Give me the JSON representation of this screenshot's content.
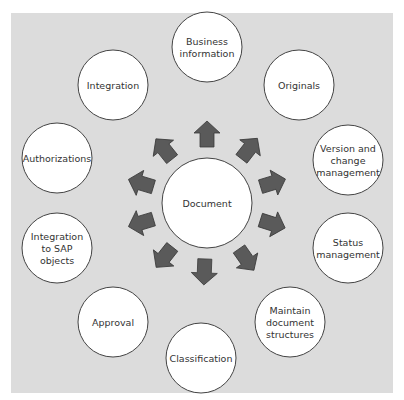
{
  "diagram": {
    "center": {
      "label": [
        "Document"
      ]
    },
    "nodes": [
      {
        "id": "business-information",
        "label": [
          "Business",
          "information"
        ]
      },
      {
        "id": "originals",
        "label": [
          "Originals"
        ]
      },
      {
        "id": "version-and-change-management",
        "label": [
          "Version and",
          "change",
          "management"
        ]
      },
      {
        "id": "status-management",
        "label": [
          "Status",
          "management"
        ]
      },
      {
        "id": "maintain-document-structures",
        "label": [
          "Maintain",
          "document",
          "structures"
        ]
      },
      {
        "id": "classification",
        "label": [
          "Classification"
        ]
      },
      {
        "id": "approval",
        "label": [
          "Approval"
        ]
      },
      {
        "id": "integration-to-sap-objects",
        "label": [
          "Integration",
          "to SAP",
          "objects"
        ]
      },
      {
        "id": "authorizations",
        "label": [
          "Authorizations"
        ]
      },
      {
        "id": "integration",
        "label": [
          "Integration"
        ]
      }
    ],
    "colors": {
      "background": "#dcdcdc",
      "node_fill": "#ffffff",
      "node_stroke": "#444444",
      "arrow_fill": "#5a5a5a",
      "arrow_stroke": "#3a3a3a"
    }
  }
}
